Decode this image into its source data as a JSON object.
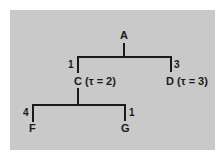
{
  "diagram": {
    "type": "tree",
    "background_color": "#c9c9c9",
    "line_color": "#1a1a1a",
    "nodes": {
      "A": {
        "label": "A"
      },
      "C": {
        "label": "C (τ = 2)"
      },
      "D": {
        "label": "D (τ = 3)"
      },
      "F": {
        "label": "F"
      },
      "G": {
        "label": "G"
      }
    },
    "edges": [
      {
        "from": "A",
        "to": "C",
        "weight": "1"
      },
      {
        "from": "A",
        "to": "D",
        "weight": "3"
      },
      {
        "from": "C",
        "to": "F",
        "weight": "4"
      },
      {
        "from": "C",
        "to": "G",
        "weight": "1"
      }
    ]
  }
}
